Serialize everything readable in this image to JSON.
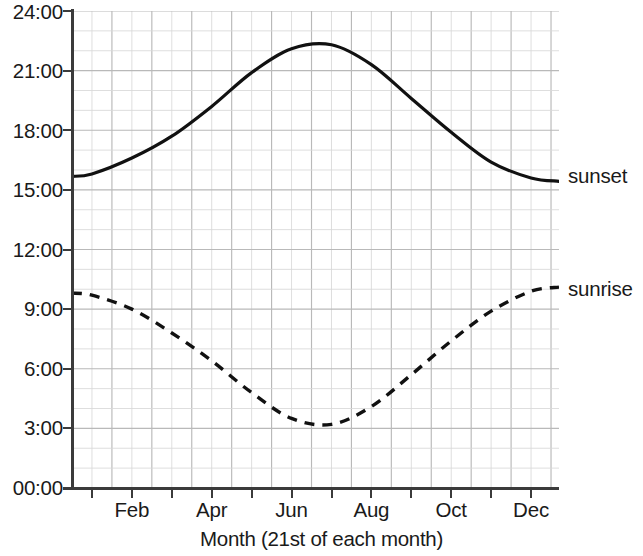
{
  "chart_data": {
    "type": "line",
    "title": "",
    "xlabel": "Month (21st of each month)",
    "ylabel": "",
    "grid": true,
    "legend_position": "right-inline",
    "x": [
      "Jan",
      "Feb",
      "Mar",
      "Apr",
      "May",
      "Jun",
      "Jul",
      "Aug",
      "Sep",
      "Oct",
      "Nov",
      "Dec"
    ],
    "x_tick_labels": [
      "",
      "Feb",
      "",
      "Apr",
      "",
      "Jun",
      "",
      "Aug",
      "",
      "Oct",
      "",
      "Dec"
    ],
    "xlim": [
      0,
      12
    ],
    "ylim": [
      0,
      24
    ],
    "y_tick_labels": [
      "00:00",
      "3:00",
      "6:00",
      "9:00",
      "12:00",
      "15:00",
      "18:00",
      "21:00",
      "24:00"
    ],
    "y_tick_values": [
      0,
      3,
      6,
      9,
      12,
      15,
      18,
      21,
      24
    ],
    "series": [
      {
        "name": "sunset",
        "style": "solid",
        "color": "#111111",
        "values": [
          15.8,
          16.6,
          17.7,
          19.2,
          20.9,
          22.1,
          22.3,
          21.3,
          19.6,
          17.9,
          16.4,
          15.6
        ]
      },
      {
        "name": "sunrise",
        "style": "dashed",
        "color": "#111111",
        "values": [
          9.7,
          9.0,
          7.8,
          6.4,
          4.8,
          3.5,
          3.2,
          4.1,
          5.7,
          7.4,
          8.9,
          9.9
        ]
      }
    ],
    "annotations": []
  },
  "axis": {
    "y_labels": [
      "24:00",
      "21:00",
      "18:00",
      "15:00",
      "12:00",
      "9:00",
      "6:00",
      "3:00",
      "00:00"
    ],
    "x_labels": [
      "Feb",
      "Apr",
      "Jun",
      "Aug",
      "Oct",
      "Dec"
    ],
    "x_title": "Month (21st of each month)"
  },
  "legend": {
    "sunset_label": "sunset",
    "sunrise_label": "sunrise"
  },
  "colors": {
    "line": "#111111",
    "grid_minor": "#d8d8d8",
    "grid_major": "#b9b9b9",
    "axis": "#3b3b3b",
    "background": "#ffffff"
  }
}
